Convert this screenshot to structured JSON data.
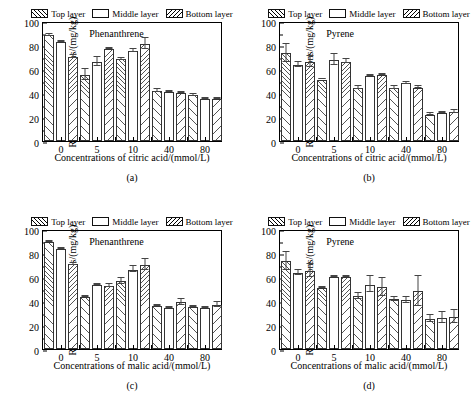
{
  "figure": {
    "legend_labels": [
      "Top layer",
      "Middle layer",
      "Bottom layer"
    ],
    "y_axis_label": "Residual concentrations/(mg/kg)",
    "y_ticks": [
      "0",
      "20",
      "40",
      "60",
      "80",
      "100"
    ]
  },
  "panels": [
    {
      "key": "a",
      "panel_label": "(a)",
      "annotation": "Phenanthrene",
      "x_axis_label": "Concentrations of citric acid/(mmol/L)",
      "chart_data": {
        "type": "bar",
        "title": "Phenanthrene",
        "xlabel": "Concentrations of citric acid/(mmol/L)",
        "ylabel": "Residual concentrations/(mg/kg)",
        "ylim": [
          0,
          100
        ],
        "grid": false,
        "legend_position": "above-plot",
        "categories": [
          "0",
          "5",
          "10",
          "40",
          "80"
        ],
        "series": [
          {
            "name": "Top layer",
            "values": [
              88,
              55,
              68,
              41.5,
              38
            ],
            "errors": [
              1.5,
              5,
              1,
              1.5,
              1
            ]
          },
          {
            "name": "Middle layer",
            "values": [
              82.5,
              66,
              75,
              41,
              35
            ],
            "errors": [
              1,
              4,
              2,
              0.8,
              0.8
            ]
          },
          {
            "name": "Bottom layer",
            "values": [
              70,
              76.5,
              81,
              40,
              35
            ],
            "errors": [
              1.5,
              0.8,
              5,
              0.8,
              0.8
            ]
          }
        ]
      }
    },
    {
      "key": "b",
      "panel_label": "(b)",
      "annotation": "Pyrene",
      "x_axis_label": "Concentrations of citric acid/(mmol/L)",
      "chart_data": {
        "type": "bar",
        "title": "Pyrene",
        "xlabel": "Concentrations of citric acid/(mmol/L)",
        "ylabel": "Residual concentrations/(mg/kg)",
        "ylim": [
          0,
          100
        ],
        "grid": false,
        "legend_position": "above-plot",
        "categories": [
          "0",
          "5",
          "10",
          "40",
          "80"
        ],
        "series": [
          {
            "name": "Top layer",
            "values": [
              73,
              51,
              44,
              44,
              22
            ],
            "errors": [
              8,
              0.5,
              1.5,
              1.5,
              1
            ]
          },
          {
            "name": "Middle layer",
            "values": [
              63.5,
              67.5,
              54,
              48,
              23
            ],
            "errors": [
              2.5,
              5,
              1,
              1,
              0.8
            ]
          },
          {
            "name": "Bottom layer",
            "values": [
              65.5,
              66,
              55,
              44.5,
              24
            ],
            "errors": [
              5,
              2,
              1,
              1,
              1.5
            ]
          }
        ]
      }
    },
    {
      "key": "c",
      "panel_label": "(c)",
      "annotation": "Phenanthrene",
      "x_axis_label": "Concentrations of malic acid/(mmol/L)",
      "chart_data": {
        "type": "bar",
        "title": "Phenanthrene",
        "xlabel": "Concentrations of malic acid/(mmol/L)",
        "ylabel": "Residual concentrations/(mg/kg)",
        "ylim": [
          0,
          100
        ],
        "grid": false,
        "legend_position": "above-plot",
        "categories": [
          "0",
          "5",
          "10",
          "40",
          "80"
        ],
        "series": [
          {
            "name": "Top layer",
            "values": [
              89,
              43.5,
              56.5,
              36,
              35
            ],
            "errors": [
              1,
              0.8,
              3,
              1,
              0.8
            ]
          },
          {
            "name": "Middle layer",
            "values": [
              83.5,
              53.5,
              66,
              34.5,
              34.5
            ],
            "errors": [
              1,
              0.8,
              3,
              0.8,
              0.8
            ]
          },
          {
            "name": "Bottom layer",
            "values": [
              70.5,
              52.5,
              70,
              39,
              37
            ],
            "errors": [
              1.5,
              2,
              5,
              3,
              2.5
            ]
          }
        ]
      }
    },
    {
      "key": "d",
      "panel_label": "(d)",
      "annotation": "Pyrene",
      "x_axis_label": "Concentrations of malic acid/(mmol/L)",
      "chart_data": {
        "type": "bar",
        "title": "Pyrene",
        "xlabel": "Concentrations of malic acid/(mmol/L)",
        "ylabel": "Residual concentrations/(mg/kg)",
        "ylim": [
          0,
          100
        ],
        "grid": false,
        "legend_position": "above-plot",
        "categories": [
          "0",
          "5",
          "10",
          "40",
          "80"
        ],
        "series": [
          {
            "name": "Top layer",
            "values": [
              73,
              50.5,
              44,
              41.5,
              25
            ],
            "errors": [
              8,
              0.8,
              3,
              2,
              3
            ]
          },
          {
            "name": "Middle layer",
            "values": [
              63.5,
              60,
              53.5,
              40.5,
              26
            ],
            "errors": [
              2.5,
              0.5,
              7,
              3,
              5
            ]
          },
          {
            "name": "Bottom layer",
            "values": [
              65,
              60,
              51.5,
              48,
              26.5
            ],
            "errors": [
              6,
              0.5,
              8,
              13,
              6
            ]
          }
        ]
      }
    }
  ]
}
